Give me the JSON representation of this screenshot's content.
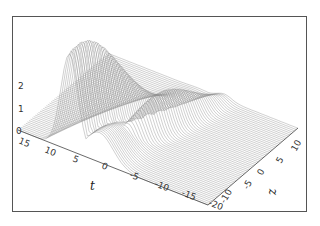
{
  "chart_data": {
    "type": "surface3d",
    "title": "",
    "z_axis": {
      "label": "",
      "ticks": [
        "0",
        "1",
        "2"
      ],
      "range": [
        0,
        2.8
      ]
    },
    "t_axis": {
      "label": "t",
      "ticks": [
        "15",
        "10",
        "5",
        "0",
        "-5",
        "-10",
        "-15",
        "-20"
      ],
      "range": [
        -20,
        15
      ]
    },
    "x_axis": {
      "label": "z",
      "ticks": [
        "-10",
        "-5",
        "0",
        "5",
        "10"
      ],
      "range": [
        -10,
        10
      ]
    },
    "features": {
      "main_peak_height": 2.7,
      "secondary_peak_height": 1.6,
      "grid": false,
      "style": "wireframe, grey lines on white"
    }
  },
  "labels": {
    "vertical_ticks": [
      "2",
      "1",
      "0"
    ],
    "t_ticks": [
      "15",
      "10",
      "5",
      "0",
      "-5",
      "-10",
      "-15",
      "-20"
    ],
    "z_ticks": [
      "-10",
      "-5",
      "0",
      "5",
      "10"
    ],
    "t_label": "t",
    "z_label": "z"
  }
}
